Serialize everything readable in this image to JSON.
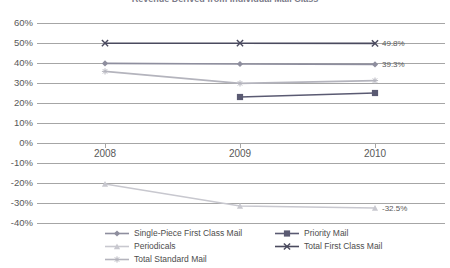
{
  "chart": {
    "title": "Revenue Derived from Individual Mail Class",
    "title_clipped": true
  },
  "chart_data": {
    "type": "line",
    "title": "Revenue Derived from Individual Mail Class",
    "xlabel": "",
    "ylabel": "",
    "x": [
      "2008",
      "2009",
      "2010"
    ],
    "ylim": [
      -40,
      60
    ],
    "ytick_labels": [
      "60%",
      "50%",
      "40%",
      "30%",
      "20%",
      "10%",
      "0%",
      "-10%",
      "-20%",
      "-30%",
      "-40%"
    ],
    "ytick_values": [
      60,
      50,
      40,
      30,
      20,
      10,
      0,
      -10,
      -20,
      -30,
      -40
    ],
    "grid": true,
    "legend_position": "bottom",
    "series": [
      {
        "name": "Single-Piece First Class Mail",
        "marker": "diamond",
        "color": "#8e8e9e",
        "values": [
          39.8,
          39.5,
          39.3
        ],
        "labels": [
          null,
          null,
          "39.3%"
        ]
      },
      {
        "name": "Priority Mail",
        "marker": "square",
        "color": "#5a5a72",
        "values": [
          null,
          23.0,
          25.0
        ],
        "labels": [
          null,
          null,
          null
        ]
      },
      {
        "name": "Periodicals",
        "marker": "triangle",
        "color": "#c8c8cf",
        "values": [
          -20.5,
          -31.5,
          -32.5
        ],
        "labels": [
          null,
          null,
          "-32.5%"
        ]
      },
      {
        "name": "Total First Class Mail",
        "marker": "x",
        "color": "#4a4a5e",
        "values": [
          49.9,
          49.9,
          49.8
        ],
        "labels": [
          null,
          null,
          "49.8%"
        ]
      },
      {
        "name": "Total Standard Mail",
        "marker": "asterisk",
        "color": "#b4b4bd",
        "values": [
          35.8,
          29.8,
          31.2
        ],
        "labels": [
          null,
          null,
          null
        ]
      }
    ]
  },
  "legend": {
    "items": [
      {
        "label": "Single-Piece First Class Mail",
        "marker": "diamond",
        "color": "#8e8e9e"
      },
      {
        "label": "Priority Mail",
        "marker": "square",
        "color": "#5a5a72"
      },
      {
        "label": "Periodicals",
        "marker": "triangle",
        "color": "#c8c8cf"
      },
      {
        "label": "Total First Class Mail",
        "marker": "x",
        "color": "#4a4a5e"
      },
      {
        "label": "Total Standard Mail",
        "marker": "asterisk",
        "color": "#b4b4bd"
      }
    ]
  }
}
